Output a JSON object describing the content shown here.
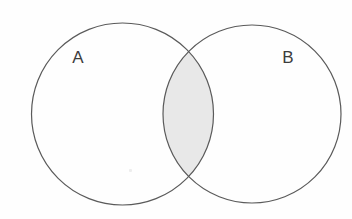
{
  "diagram": {
    "type": "venn-two-set",
    "title": "",
    "background_color": "#fefefe",
    "stroke_color": "#5a5a5a",
    "stroke_width": 1.2,
    "shaded_region": "intersection",
    "shade_color": "#e8e8e8",
    "label_color": "#3c3c3c",
    "sets": [
      {
        "id": "A",
        "label": "A",
        "fill": "none",
        "center_x": 122.5,
        "center_y": 114,
        "radius": 91,
        "label_x": 78,
        "label_y": 63
      },
      {
        "id": "B",
        "label": "B",
        "fill": "none",
        "center_x": 252,
        "center_y": 114,
        "radius": 89,
        "label_x": 282,
        "label_y": 63
      }
    ],
    "intersection": {
      "label": "",
      "shaded": true,
      "top_crossing_x": 188,
      "top_crossing_y": 45,
      "bottom_crossing_x": 188,
      "bottom_crossing_y": 184
    },
    "artifacts": [
      {
        "name": "scan-speck",
        "x": 129,
        "y": 169
      }
    ]
  }
}
